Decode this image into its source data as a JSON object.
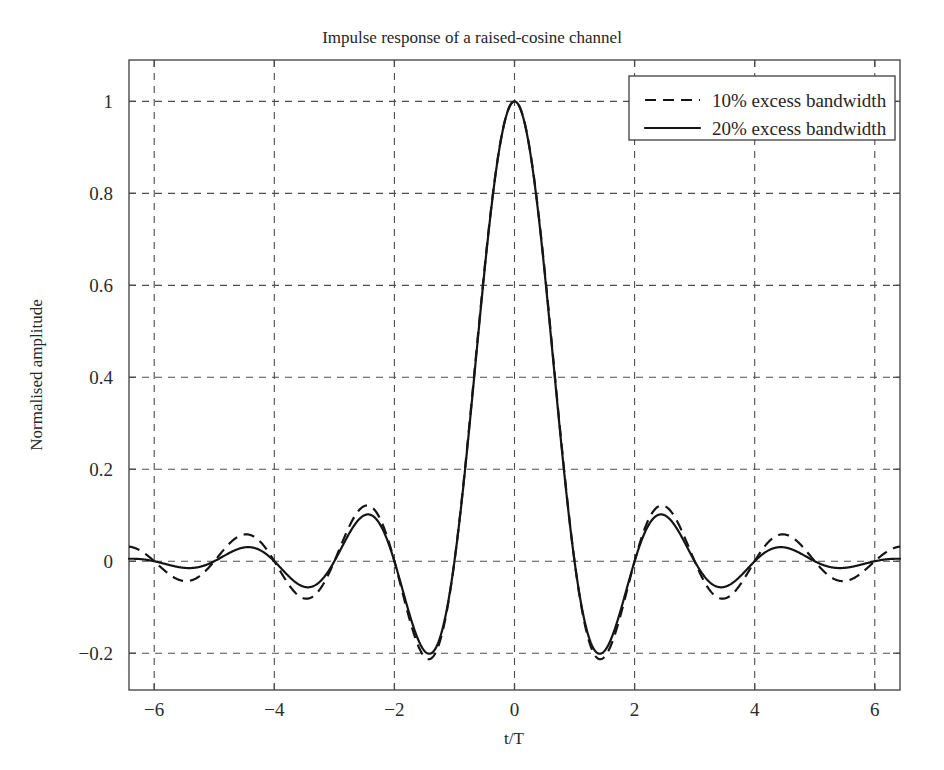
{
  "chart_data": {
    "type": "line",
    "title": "Impulse response of a raised-cosine channel",
    "xlabel": "t/T",
    "ylabel": "Normalised amplitude",
    "xlim": [
      -6.42,
      6.42
    ],
    "ylim": [
      -0.28,
      1.09
    ],
    "xticks": [
      -6,
      -4,
      -2,
      0,
      2,
      4,
      6
    ],
    "xticklabels": [
      "−6",
      "−4",
      "−2",
      "0",
      "2",
      "4",
      "6"
    ],
    "yticks": [
      -0.2,
      0,
      0.2,
      0.4,
      0.6,
      0.8,
      1
    ],
    "yticklabels": [
      "−0.2",
      "0",
      "0.2",
      "0.4",
      "0.6",
      "0.8",
      "1"
    ],
    "grid": true,
    "grid_style": "dashed",
    "legend_position": "upper right",
    "legend_entries": [
      "10% excess bandwidth",
      "20% excess bandwidth"
    ],
    "series": [
      {
        "name": "10% excess bandwidth",
        "style": "dashed",
        "color": "#151515",
        "rolloff": 0.1,
        "formula": "sinc(t/T) * cos(pi*beta*t/T) / (1 - (2*beta*t/T)^2)",
        "key_points": [
          {
            "x": 0,
            "y": 1
          },
          {
            "x": 1,
            "y": 0
          },
          {
            "x": 1.4,
            "y": -0.21
          },
          {
            "x": 2,
            "y": 0
          },
          {
            "x": 2.45,
            "y": 0.128
          },
          {
            "x": 3,
            "y": 0
          },
          {
            "x": 3.45,
            "y": -0.075
          },
          {
            "x": 4,
            "y": 0
          },
          {
            "x": 4.5,
            "y": 0.055
          },
          {
            "x": 5,
            "y": 0
          },
          {
            "x": 5.5,
            "y": -0.042
          },
          {
            "x": 6,
            "y": 0
          },
          {
            "x": 6.4,
            "y": 0.035
          }
        ]
      },
      {
        "name": "20% excess bandwidth",
        "style": "solid",
        "color": "#151515",
        "rolloff": 0.2,
        "formula": "sinc(t/T) * cos(pi*beta*t/T) / (1 - (2*beta*t/T)^2)",
        "key_points": [
          {
            "x": 0,
            "y": 1
          },
          {
            "x": 1,
            "y": 0
          },
          {
            "x": 1.4,
            "y": -0.205
          },
          {
            "x": 2,
            "y": 0
          },
          {
            "x": 2.45,
            "y": 0.108
          },
          {
            "x": 3,
            "y": 0
          },
          {
            "x": 3.45,
            "y": -0.052
          },
          {
            "x": 4,
            "y": 0
          },
          {
            "x": 4.5,
            "y": 0.027
          },
          {
            "x": 5,
            "y": 0
          },
          {
            "x": 5.5,
            "y": -0.015
          },
          {
            "x": 6,
            "y": 0
          },
          {
            "x": 6.4,
            "y": 0.009
          }
        ]
      }
    ]
  }
}
